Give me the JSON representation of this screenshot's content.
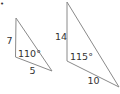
{
  "bullet": "•",
  "figure": {
    "stroke_color": "#8a8a8a",
    "text_color": "#333333",
    "triangles": [
      {
        "name": "small-triangle",
        "vertices": [
          [
            16,
            18
          ],
          [
            15.5,
            57
          ],
          [
            52,
            71
          ]
        ],
        "side_left": "7",
        "angle": "110°",
        "side_bottom": "5"
      },
      {
        "name": "large-triangle",
        "vertices": [
          [
            67,
            2
          ],
          [
            67,
            61
          ],
          [
            119,
            87
          ]
        ],
        "side_left": "14",
        "angle": "115°",
        "side_bottom": "10"
      }
    ]
  }
}
